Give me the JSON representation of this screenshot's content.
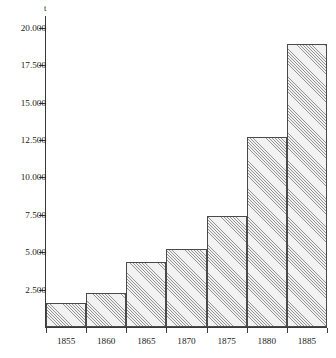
{
  "chart_data": {
    "type": "bar",
    "title": "",
    "subtitle": "",
    "xlabel": "",
    "ylabel": "",
    "unit_label": "t",
    "categories": [
      "1855",
      "1860",
      "1865",
      "1870",
      "1875",
      "1880",
      "1885"
    ],
    "values": [
      1600,
      2300,
      4350,
      5250,
      7400,
      12700,
      18900
    ],
    "value_labels": [
      "1.600",
      "2.300",
      "4.350",
      "5.250",
      "7.400",
      "12.700",
      "18.900"
    ],
    "ylim": [
      0,
      20800
    ],
    "ytick_values": [
      2500,
      5000,
      7500,
      10000,
      12500,
      15000,
      17500,
      20000
    ],
    "ytick_labels": [
      "2.500",
      "5.000",
      "7.500",
      "10.000",
      "12.500",
      "15.000",
      "17.500",
      "20.000"
    ],
    "grid": false,
    "legend": false,
    "legend_position": "none",
    "series": [
      {
        "name": "",
        "values": [
          1600,
          2300,
          4350,
          5250,
          7400,
          12700,
          18900
        ]
      }
    ],
    "style": {
      "bar_fill": "#f2f2f2",
      "bar_hatch": "diagonal-45",
      "bar_border": "#4a4a4a",
      "axis_color": "#3a3a3a",
      "text_color": "#1a1a1a",
      "background": "#ffffff",
      "bar_gap": 0
    }
  }
}
